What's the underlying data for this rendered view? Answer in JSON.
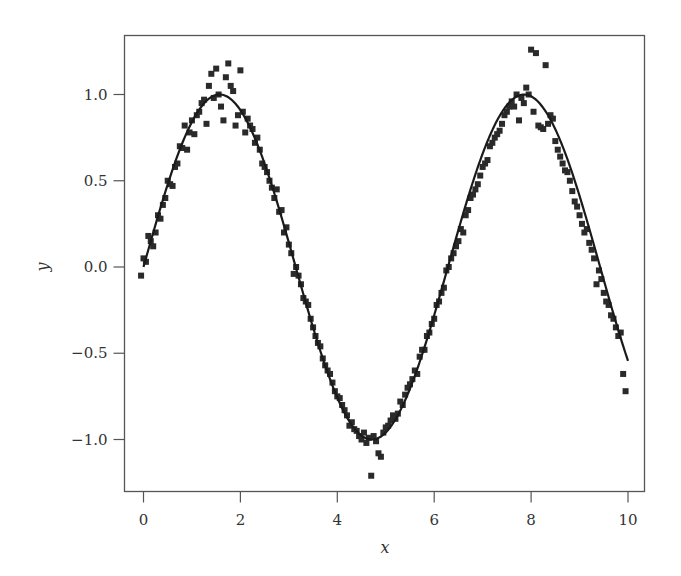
{
  "chart_data": {
    "type": "scatter",
    "title": "",
    "xlabel": "x",
    "ylabel": "y",
    "xlim": [
      -0.4,
      10.35
    ],
    "ylim": [
      -1.3,
      1.34
    ],
    "xticks": [
      0,
      2,
      4,
      6,
      8,
      10
    ],
    "xtick_labels": [
      "0",
      "2",
      "4",
      "6",
      "8",
      "10"
    ],
    "yticks": [
      -1.0,
      -0.5,
      0.0,
      0.5,
      1.0
    ],
    "ytick_labels": [
      "−1.0",
      "−0.5",
      "0.0",
      "0.5",
      "1.0"
    ],
    "grid": false,
    "legend": null,
    "series": [
      {
        "name": "noisy samples",
        "kind": "scatter",
        "marker": "square",
        "color": "#2a2a2a",
        "points": [
          [
            -0.05,
            -0.05
          ],
          [
            0.0,
            0.05
          ],
          [
            0.05,
            0.03
          ],
          [
            0.1,
            0.18
          ],
          [
            0.15,
            0.15
          ],
          [
            0.2,
            0.12
          ],
          [
            0.25,
            0.2
          ],
          [
            0.3,
            0.3
          ],
          [
            0.35,
            0.28
          ],
          [
            0.4,
            0.36
          ],
          [
            0.45,
            0.4
          ],
          [
            0.5,
            0.5
          ],
          [
            0.55,
            0.48
          ],
          [
            0.6,
            0.47
          ],
          [
            0.65,
            0.58
          ],
          [
            0.7,
            0.6
          ],
          [
            0.75,
            0.7
          ],
          [
            0.8,
            0.69
          ],
          [
            0.85,
            0.82
          ],
          [
            0.9,
            0.68
          ],
          [
            0.95,
            0.78
          ],
          [
            1.0,
            0.85
          ],
          [
            1.05,
            0.77
          ],
          [
            1.1,
            0.88
          ],
          [
            1.15,
            0.9
          ],
          [
            1.2,
            0.95
          ],
          [
            1.25,
            0.97
          ],
          [
            1.3,
            0.83
          ],
          [
            1.35,
            1.05
          ],
          [
            1.4,
            1.12
          ],
          [
            1.45,
            0.98
          ],
          [
            1.5,
            1.15
          ],
          [
            1.55,
            1.0
          ],
          [
            1.6,
            0.93
          ],
          [
            1.65,
            0.85
          ],
          [
            1.7,
            1.1
          ],
          [
            1.75,
            1.18
          ],
          [
            1.8,
            1.05
          ],
          [
            1.85,
            1.02
          ],
          [
            1.9,
            0.82
          ],
          [
            1.95,
            0.88
          ],
          [
            2.0,
            1.14
          ],
          [
            2.05,
            0.9
          ],
          [
            2.1,
            0.78
          ],
          [
            2.15,
            0.86
          ],
          [
            2.2,
            0.82
          ],
          [
            2.25,
            0.8
          ],
          [
            2.3,
            0.72
          ],
          [
            2.35,
            0.75
          ],
          [
            2.4,
            0.68
          ],
          [
            2.45,
            0.6
          ],
          [
            2.5,
            0.58
          ],
          [
            2.55,
            0.55
          ],
          [
            2.6,
            0.5
          ],
          [
            2.65,
            0.46
          ],
          [
            2.7,
            0.4
          ],
          [
            2.75,
            0.45
          ],
          [
            2.8,
            0.32
          ],
          [
            2.85,
            0.33
          ],
          [
            2.9,
            0.2
          ],
          [
            2.95,
            0.23
          ],
          [
            3.0,
            0.13
          ],
          [
            3.05,
            0.08
          ],
          [
            3.1,
            -0.04
          ],
          [
            3.15,
            0.0
          ],
          [
            3.2,
            -0.05
          ],
          [
            3.25,
            -0.1
          ],
          [
            3.3,
            -0.18
          ],
          [
            3.35,
            -0.2
          ],
          [
            3.4,
            -0.22
          ],
          [
            3.45,
            -0.3
          ],
          [
            3.5,
            -0.35
          ],
          [
            3.55,
            -0.4
          ],
          [
            3.6,
            -0.44
          ],
          [
            3.65,
            -0.46
          ],
          [
            3.7,
            -0.53
          ],
          [
            3.75,
            -0.57
          ],
          [
            3.8,
            -0.6
          ],
          [
            3.85,
            -0.62
          ],
          [
            3.9,
            -0.67
          ],
          [
            3.95,
            -0.72
          ],
          [
            4.0,
            -0.75
          ],
          [
            4.05,
            -0.76
          ],
          [
            4.1,
            -0.8
          ],
          [
            4.15,
            -0.83
          ],
          [
            4.2,
            -0.86
          ],
          [
            4.25,
            -0.92
          ],
          [
            4.3,
            -0.9
          ],
          [
            4.35,
            -0.94
          ],
          [
            4.4,
            -0.95
          ],
          [
            4.45,
            -0.98
          ],
          [
            4.5,
            -1.0
          ],
          [
            4.55,
            -0.96
          ],
          [
            4.6,
            -1.02
          ],
          [
            4.65,
            -0.99
          ],
          [
            4.7,
            -1.21
          ],
          [
            4.75,
            -0.98
          ],
          [
            4.8,
            -1.01
          ],
          [
            4.85,
            -1.08
          ],
          [
            4.9,
            -1.1
          ],
          [
            4.95,
            -0.96
          ],
          [
            5.0,
            -0.93
          ],
          [
            5.05,
            -0.92
          ],
          [
            5.1,
            -0.89
          ],
          [
            5.15,
            -0.86
          ],
          [
            5.2,
            -0.88
          ],
          [
            5.25,
            -0.85
          ],
          [
            5.3,
            -0.78
          ],
          [
            5.35,
            -0.8
          ],
          [
            5.4,
            -0.74
          ],
          [
            5.45,
            -0.7
          ],
          [
            5.5,
            -0.68
          ],
          [
            5.55,
            -0.65
          ],
          [
            5.6,
            -0.6
          ],
          [
            5.65,
            -0.62
          ],
          [
            5.7,
            -0.52
          ],
          [
            5.75,
            -0.48
          ],
          [
            5.8,
            -0.48
          ],
          [
            5.85,
            -0.4
          ],
          [
            5.9,
            -0.38
          ],
          [
            5.95,
            -0.33
          ],
          [
            6.0,
            -0.3
          ],
          [
            6.05,
            -0.22
          ],
          [
            6.1,
            -0.2
          ],
          [
            6.15,
            -0.15
          ],
          [
            6.2,
            -0.12
          ],
          [
            6.25,
            -0.02
          ],
          [
            6.3,
            0.0
          ],
          [
            6.35,
            0.05
          ],
          [
            6.4,
            0.08
          ],
          [
            6.45,
            0.12
          ],
          [
            6.5,
            0.15
          ],
          [
            6.55,
            0.22
          ],
          [
            6.6,
            0.2
          ],
          [
            6.65,
            0.3
          ],
          [
            6.7,
            0.33
          ],
          [
            6.75,
            0.4
          ],
          [
            6.8,
            0.42
          ],
          [
            6.85,
            0.45
          ],
          [
            6.9,
            0.48
          ],
          [
            6.95,
            0.53
          ],
          [
            7.0,
            0.58
          ],
          [
            7.05,
            0.6
          ],
          [
            7.1,
            0.62
          ],
          [
            7.15,
            0.7
          ],
          [
            7.2,
            0.72
          ],
          [
            7.25,
            0.75
          ],
          [
            7.3,
            0.77
          ],
          [
            7.35,
            0.79
          ],
          [
            7.4,
            0.83
          ],
          [
            7.45,
            0.88
          ],
          [
            7.5,
            0.9
          ],
          [
            7.55,
            0.93
          ],
          [
            7.6,
            0.96
          ],
          [
            7.65,
            0.93
          ],
          [
            7.7,
            1.0
          ],
          [
            7.75,
            0.85
          ],
          [
            7.8,
            0.98
          ],
          [
            7.85,
            0.95
          ],
          [
            7.9,
            1.04
          ],
          [
            7.95,
            1.0
          ],
          [
            8.0,
            1.26
          ],
          [
            8.05,
            0.9
          ],
          [
            8.1,
            1.24
          ],
          [
            8.15,
            0.82
          ],
          [
            8.2,
            0.81
          ],
          [
            8.25,
            0.8
          ],
          [
            8.3,
            1.17
          ],
          [
            8.35,
            0.83
          ],
          [
            8.4,
            0.88
          ],
          [
            8.45,
            0.86
          ],
          [
            8.5,
            0.73
          ],
          [
            8.55,
            0.68
          ],
          [
            8.6,
            0.64
          ],
          [
            8.65,
            0.6
          ],
          [
            8.7,
            0.56
          ],
          [
            8.75,
            0.55
          ],
          [
            8.8,
            0.5
          ],
          [
            8.85,
            0.44
          ],
          [
            8.9,
            0.38
          ],
          [
            8.95,
            0.35
          ],
          [
            9.0,
            0.3
          ],
          [
            9.05,
            0.25
          ],
          [
            9.1,
            0.2
          ],
          [
            9.15,
            0.22
          ],
          [
            9.2,
            0.14
          ],
          [
            9.25,
            0.1
          ],
          [
            9.3,
            0.05
          ],
          [
            9.35,
            -0.1
          ],
          [
            9.4,
            -0.02
          ],
          [
            9.45,
            -0.07
          ],
          [
            9.5,
            -0.15
          ],
          [
            9.55,
            -0.2
          ],
          [
            9.6,
            -0.22
          ],
          [
            9.65,
            -0.28
          ],
          [
            9.7,
            -0.3
          ],
          [
            9.75,
            -0.35
          ],
          [
            9.8,
            -0.4
          ],
          [
            9.85,
            -0.38
          ],
          [
            9.9,
            -0.62
          ],
          [
            9.95,
            -0.72
          ]
        ]
      },
      {
        "name": "sin(x)",
        "kind": "line",
        "color": "#1a1a1a",
        "function": "sin(x)",
        "x_range": [
          0,
          10
        ]
      }
    ]
  }
}
